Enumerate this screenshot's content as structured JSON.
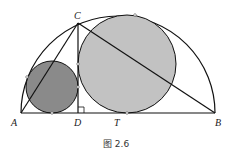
{
  "figure": {
    "caption": "图 2.6",
    "labels": {
      "A": "A",
      "B": "B",
      "C": "C",
      "D": "D",
      "T": "T"
    },
    "colors": {
      "small_circle": "#8a8a8a",
      "large_circle": "#c2c2c2",
      "stroke": "#111111"
    }
  }
}
